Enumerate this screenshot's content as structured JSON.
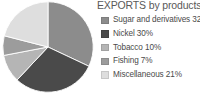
{
  "chart_data": {
    "type": "pie",
    "title": "EXPORTS by products",
    "xlabel": "",
    "ylabel": "",
    "legend_position": "right",
    "grid": false,
    "categories": [
      "Sugar and derivatives",
      "Nickel",
      "Tobacco",
      "Fishing",
      "Miscellaneous"
    ],
    "values": [
      32,
      30,
      10,
      7,
      21
    ],
    "value_unit": "%",
    "colors": [
      "#8c8c8c",
      "#4a4a4a",
      "#b5b5b5",
      "#9c9c9c",
      "#dedede"
    ],
    "start_angle_deg": 0,
    "direction": "clockwise",
    "slices": [
      {
        "label": "Sugar and derivatives",
        "value": 32,
        "legend_text": "Sugar and derivatives 32%",
        "color": "#8c8c8c"
      },
      {
        "label": "Nickel",
        "value": 30,
        "legend_text": "Nickel 30%",
        "color": "#4a4a4a"
      },
      {
        "label": "Tobacco",
        "value": 10,
        "legend_text": "Tobacco 10%",
        "color": "#b5b5b5"
      },
      {
        "label": "Fishing",
        "value": 7,
        "legend_text": "Fishing 7%",
        "color": "#9c9c9c"
      },
      {
        "label": "Miscellaneous",
        "value": 21,
        "legend_text": "Miscellaneous 21%",
        "color": "#dedede"
      }
    ]
  },
  "legend": {
    "items": [
      {
        "text": "Sugar and derivatives 32%",
        "color": "#8c8c8c"
      },
      {
        "text": "Nickel 30%",
        "color": "#4a4a4a"
      },
      {
        "text": "Tobacco 10%",
        "color": "#b5b5b5"
      },
      {
        "text": "Fishing 7%",
        "color": "#9c9c9c"
      },
      {
        "text": "Miscellaneous 21%",
        "color": "#dedede"
      }
    ]
  }
}
